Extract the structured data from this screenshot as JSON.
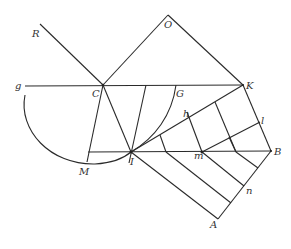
{
  "diagram": {
    "type": "geometric-construction",
    "labels": {
      "R": "R",
      "O": "O",
      "g": "g",
      "C": "C",
      "G": "G",
      "K": "K",
      "h": "h",
      "l": "l",
      "M": "M",
      "I": "I",
      "m": "m",
      "B": "B",
      "n": "n",
      "A": "A"
    },
    "colors": {
      "line": "#2a2a2a",
      "label": "#333333",
      "background": "#ffffff"
    }
  }
}
